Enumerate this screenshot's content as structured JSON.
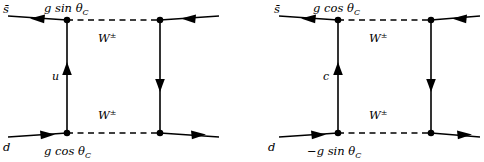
{
  "figure": {
    "type": "feynman-diagram",
    "background_color": "#ffffff",
    "line_color": "#000000",
    "canvas": {
      "width": 484,
      "height": 162
    }
  },
  "diagrams": [
    {
      "id": "left",
      "name": "u-quark-box-diagram",
      "box": {
        "left_x": 67,
        "right_x": 160,
        "top_y": 20,
        "bottom_y": 133
      },
      "internal_fermion": {
        "label": "u",
        "label_x": 52,
        "label_y": 80,
        "arrow_direction": "up"
      },
      "right_internal_fermion": {
        "arrow_direction": "down"
      },
      "bosons": [
        {
          "label": "W",
          "superscript": "±",
          "position": "top",
          "label_x": 98,
          "label_y": 42
        },
        {
          "label": "W",
          "superscript": "±",
          "position": "bottom",
          "label_x": 98,
          "label_y": 119
        }
      ],
      "couplings": [
        {
          "label": "g sin θ",
          "subscript": "C",
          "position": "top-vertex",
          "label_x": 44,
          "label_y": 12
        },
        {
          "label": "g cos θ",
          "subscript": "C",
          "position": "bottom-vertex",
          "label_x": 44,
          "label_y": 155
        }
      ],
      "external_legs": [
        {
          "name": "incoming-antistrange",
          "label": "s̄",
          "label_x": 3,
          "label_y": 13,
          "arrow_direction": "left",
          "corner": "top-left"
        },
        {
          "name": "outgoing-top-right",
          "label": "",
          "arrow_direction": "left",
          "corner": "top-right"
        },
        {
          "name": "incoming-down",
          "label": "d",
          "label_x": 3,
          "label_y": 151,
          "arrow_direction": "right",
          "corner": "bottom-left"
        },
        {
          "name": "outgoing-bottom-right",
          "label": "",
          "arrow_direction": "right",
          "corner": "bottom-right"
        }
      ]
    },
    {
      "id": "right",
      "name": "c-quark-box-diagram",
      "box": {
        "left_x": 338,
        "right_x": 431,
        "top_y": 20,
        "bottom_y": 133
      },
      "internal_fermion": {
        "label": "c",
        "label_x": 323,
        "label_y": 80,
        "arrow_direction": "up"
      },
      "right_internal_fermion": {
        "arrow_direction": "down"
      },
      "bosons": [
        {
          "label": "W",
          "superscript": "±",
          "position": "top",
          "label_x": 369,
          "label_y": 42
        },
        {
          "label": "W",
          "superscript": "±",
          "position": "bottom",
          "label_x": 369,
          "label_y": 119
        }
      ],
      "couplings": [
        {
          "label": "g cos θ",
          "subscript": "C",
          "position": "top-vertex",
          "label_x": 313,
          "label_y": 12
        },
        {
          "label": "−g sin θ",
          "subscript": "C",
          "position": "bottom-vertex",
          "label_x": 307,
          "label_y": 155
        }
      ],
      "external_legs": [
        {
          "name": "incoming-antistrange",
          "label": "s̄",
          "label_x": 274,
          "label_y": 13,
          "arrow_direction": "left",
          "corner": "top-left"
        },
        {
          "name": "outgoing-top-right",
          "label": "",
          "arrow_direction": "left",
          "corner": "top-right"
        },
        {
          "name": "incoming-down",
          "label": "d",
          "label_x": 268,
          "label_y": 151,
          "arrow_direction": "right",
          "corner": "bottom-left"
        },
        {
          "name": "outgoing-bottom-right",
          "label": "",
          "arrow_direction": "right",
          "corner": "bottom-right"
        }
      ]
    }
  ]
}
